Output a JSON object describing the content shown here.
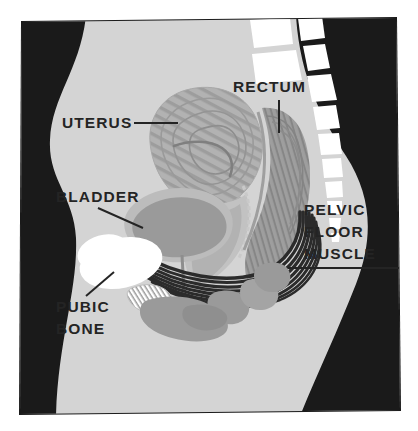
{
  "figure": {
    "type": "anatomical-illustration",
    "width": 418,
    "height": 431
  },
  "colors": {
    "page_background": "#ffffff",
    "frame_border": "#1a1a1a",
    "body_background": "#d4d4d4",
    "outside_body": "#1a1a1a",
    "organ_light": "#b7b7b7",
    "organ_mid": "#a0a0a0",
    "organ_dark": "#8e8e8e",
    "bone_white": "#ffffff",
    "muscle_dark": "#2b2b2b",
    "label_text": "#242424",
    "leader_line": "#242424"
  },
  "labels": [
    {
      "id": "uterus",
      "lines": [
        "UTERUS"
      ],
      "text_x": 62,
      "text_y": 128,
      "anchor": "start",
      "leader": {
        "x1": 134,
        "y1": 123,
        "x2": 178,
        "y2": 123
      }
    },
    {
      "id": "bladder",
      "lines": [
        "BLADDER"
      ],
      "text_x": 56,
      "text_y": 202,
      "anchor": "start",
      "leader": {
        "x1": 98,
        "y1": 208,
        "x2": 143,
        "y2": 228
      }
    },
    {
      "id": "pubic-bone",
      "lines": [
        "PUBIC",
        "BONE"
      ],
      "text_x": 56,
      "text_y": 312,
      "anchor": "start",
      "leader": {
        "x1": 86,
        "y1": 296,
        "x2": 114,
        "y2": 272
      }
    },
    {
      "id": "rectum",
      "lines": [
        "RECTUM"
      ],
      "text_x": 233,
      "text_y": 92,
      "anchor": "start",
      "leader": {
        "x1": 279,
        "y1": 100,
        "x2": 279,
        "y2": 133
      }
    },
    {
      "id": "pelvic-floor-muscle",
      "lines": [
        "PELVIC",
        "FLOOR",
        "MUSCLE"
      ],
      "text_x": 304,
      "text_y": 215,
      "anchor": "start",
      "leader": {
        "x1": 288,
        "y1": 268,
        "x2": 399,
        "y2": 268
      }
    }
  ],
  "structures": [
    {
      "id": "uterus",
      "name": "uterus",
      "fill": "#b0b0b0",
      "texture": "concentric-striations"
    },
    {
      "id": "bladder",
      "name": "bladder",
      "fill": "#9a9a9a",
      "wall": "#bcbcbc"
    },
    {
      "id": "rectum",
      "name": "rectum",
      "fill": "#9c9c9c",
      "texture": "longitudinal-striations"
    },
    {
      "id": "pelvic-floor-muscle",
      "name": "pelvic-floor-muscle",
      "fill": "#2b2b2b",
      "texture": "parallel-fibers"
    },
    {
      "id": "pubic-bone",
      "name": "pubic-bone",
      "fill": "#ffffff"
    },
    {
      "id": "sacrum",
      "name": "sacrum-vertebrae",
      "fill": "#ffffff",
      "segments": 7
    },
    {
      "id": "lumbar-spine",
      "name": "lumbar-vertebrae",
      "fill": "#ffffff",
      "segments": 3
    },
    {
      "id": "vagina",
      "name": "vaginal-canal",
      "fill": "#bcbcbc"
    },
    {
      "id": "urethra",
      "name": "urethra-hatched",
      "fill": "#ffffff",
      "texture": "hatched"
    },
    {
      "id": "perineum",
      "name": "perineal-structures",
      "fill": "#9a9a9a"
    }
  ]
}
